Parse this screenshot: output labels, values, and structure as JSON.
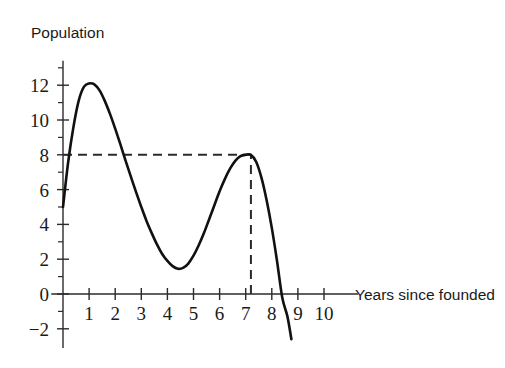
{
  "chart_data": {
    "type": "line",
    "title": "",
    "xlabel": "Years since founded",
    "ylabel": "Population",
    "xlim": [
      -0.45,
      11.3
    ],
    "ylim": [
      -3.1,
      13.4
    ],
    "grid": false,
    "legend": null,
    "x_ticks": [
      1,
      2,
      3,
      4,
      5,
      6,
      7,
      8,
      9,
      10
    ],
    "x_tick_labels": [
      "1",
      "2",
      "3",
      "4",
      "5",
      "6",
      "7",
      "8",
      "9",
      "10"
    ],
    "y_ticks": [
      -2,
      0,
      2,
      4,
      6,
      8,
      10,
      12
    ],
    "y_tick_labels": [
      "−2",
      "0",
      "2",
      "4",
      "6",
      "8",
      "10",
      "12"
    ],
    "y_minor_ticks": [
      -1,
      1,
      3,
      5,
      7,
      9,
      11,
      13
    ],
    "series": [
      {
        "name": "population",
        "color": "#111111",
        "x": [
          0.0,
          0.2,
          0.4,
          0.6,
          0.8,
          1.0,
          1.2,
          1.4,
          1.6,
          1.8,
          2.0,
          2.2,
          2.4,
          2.6,
          2.8,
          3.0,
          3.2,
          3.4,
          3.6,
          3.8,
          4.0,
          4.2,
          4.4,
          4.6,
          4.8,
          5.0,
          5.2,
          5.4,
          5.6,
          5.8,
          6.0,
          6.2,
          6.4,
          6.6,
          6.8,
          7.0,
          7.2,
          7.4,
          7.6,
          7.8,
          8.0,
          8.2,
          8.4,
          8.6,
          8.75
        ],
        "y": [
          5.0,
          7.6,
          9.6,
          11.1,
          11.9,
          12.1,
          12.05,
          11.7,
          11.1,
          10.35,
          9.5,
          8.6,
          7.65,
          6.75,
          5.85,
          5.0,
          4.2,
          3.5,
          2.85,
          2.3,
          1.9,
          1.6,
          1.45,
          1.5,
          1.75,
          2.2,
          2.8,
          3.5,
          4.3,
          5.1,
          5.9,
          6.6,
          7.2,
          7.65,
          7.92,
          8.0,
          8.0,
          7.6,
          6.7,
          5.4,
          3.8,
          1.9,
          -0.2,
          -1.3,
          -2.6
        ]
      }
    ],
    "annotations": [
      {
        "name": "horizontal-guide",
        "type": "dashed-horizontal",
        "y": 8,
        "x_from": 0,
        "x_to": 7.2
      },
      {
        "name": "vertical-guide",
        "type": "dashed-vertical",
        "x": 7.2,
        "y_from": 0,
        "y_to": 8
      }
    ],
    "key_points": {
      "start": [
        0,
        5
      ],
      "first_peak": [
        1.15,
        12.1
      ],
      "trough": [
        4.4,
        1.45
      ],
      "second_peak": [
        7.2,
        8
      ],
      "zero_crossing": [
        8.6,
        0
      ],
      "end": [
        8.75,
        -2.6
      ]
    }
  }
}
